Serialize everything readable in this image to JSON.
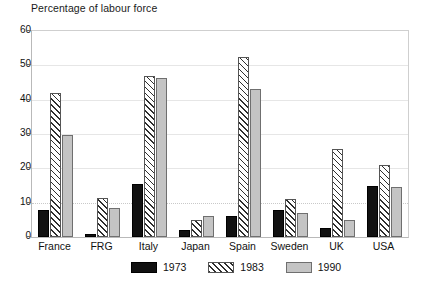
{
  "chart_data": {
    "type": "bar",
    "title": "Percentage of labour force",
    "xlabel": "",
    "ylabel": "",
    "ylim": [
      0,
      60
    ],
    "yticks": [
      0,
      10,
      20,
      30,
      40,
      50,
      60
    ],
    "grid": true,
    "legend_position": "bottom-center",
    "categories": [
      "France",
      "FRG",
      "Italy",
      "Japan",
      "Spain",
      "Sweden",
      "UK",
      "USA"
    ],
    "series": [
      {
        "name": "1973",
        "style": "solid-black",
        "color": "#111111",
        "values": [
          8,
          1,
          15.5,
          2,
          6,
          8,
          2.5,
          15
        ]
      },
      {
        "name": "1983",
        "style": "diagonal-hatch",
        "color": "#ffffff",
        "values": [
          42,
          11.5,
          47,
          5,
          52.5,
          11,
          25.5,
          21
        ]
      },
      {
        "name": "1990",
        "style": "solid-gray",
        "color": "#c4c4c4",
        "values": [
          29.8,
          8.5,
          46.4,
          6,
          43,
          7,
          5,
          14.5
        ]
      }
    ]
  },
  "legend": {
    "items": [
      {
        "label": "1973"
      },
      {
        "label": "1983"
      },
      {
        "label": "1990"
      }
    ]
  },
  "bottom_caption": ""
}
